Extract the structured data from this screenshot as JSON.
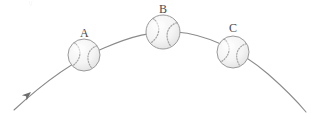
{
  "figure": {
    "name": "baseball-projectile-trajectory",
    "background_color": "#ffffff",
    "width": 311,
    "height": 114
  },
  "trajectory": {
    "name": "projectile-path",
    "stroke_color": "#8a8a8a",
    "stroke_width": 1.1,
    "description": "parabolic arc rising from lower left to apex then descending to lower right",
    "path": "M 14 110 C 40 86, 70 62, 104 48 C 132 36, 152 31, 176 32 C 206 34, 240 50, 268 74 C 284 88, 296 100, 306 112"
  },
  "arrow": {
    "name": "direction-of-motion-arrow",
    "color": "#6f6f6f",
    "x": 31,
    "y": 92,
    "rotation_deg": -41,
    "points": "0,0 -9,3.6 -6.6,0 -9,-3.6"
  },
  "balls": [
    {
      "id": "ball-a",
      "label": "A",
      "cx": 84,
      "cy": 55,
      "r": 16,
      "label_x": 80,
      "label_y": 27,
      "seam_rotation_deg": 8
    },
    {
      "id": "ball-b",
      "label": "B",
      "cx": 163,
      "cy": 32,
      "r": 17,
      "label_x": 159,
      "label_y": 3,
      "seam_rotation_deg": 10
    },
    {
      "id": "ball-c",
      "label": "C",
      "cx": 233,
      "cy": 52,
      "r": 16,
      "label_x": 229,
      "label_y": 22,
      "seam_rotation_deg": 12
    }
  ],
  "ball_style": {
    "fill_color": "#f7f7f7",
    "outline_color": "#9a9a9a",
    "seam_color": "#a6a6a6",
    "shade_color": "#ebebeb",
    "highlight_color": "#fdfdfd",
    "seam_left_path": "M -11.5 -11 C -3 -6.5, -1.5 3.5, -9 11.5",
    "seam_right_path": "M 11.5 -11 C 3 -6.5, 1.5 3.5, 9 11.5"
  },
  "artifact": {
    "name": "faint-top-marking",
    "x": 29,
    "y": 1,
    "color": "#f2f2f2"
  }
}
